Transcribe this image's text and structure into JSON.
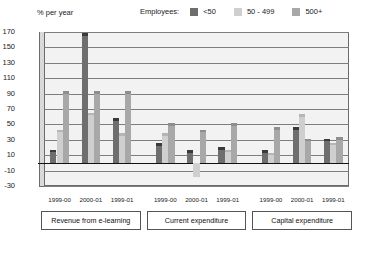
{
  "unit_label": "% per year",
  "legend": {
    "title": "Employees:",
    "items": [
      {
        "label": "<50",
        "color": "#6e6e6e"
      },
      {
        "label": "50 - 499",
        "color": "#cfcfcf"
      },
      {
        "label": "500+",
        "color": "#a8a8a8"
      }
    ]
  },
  "category_boxes": [
    {
      "label": "Revenue from e-learning"
    },
    {
      "label": "Current expenditure"
    },
    {
      "label": "Capital expenditure"
    }
  ],
  "chart_data": {
    "type": "bar",
    "title": "",
    "subtitle": "",
    "xlabel": "",
    "ylabel": "% per year",
    "ylim": [
      -30,
      170
    ],
    "yticks": [
      170,
      150,
      130,
      110,
      90,
      70,
      50,
      30,
      10,
      -10,
      -30
    ],
    "ytick_labels": [
      "170",
      "150",
      "130",
      "110",
      "90",
      "70",
      "50",
      "30",
      "10",
      "-10",
      "-30"
    ],
    "grid": true,
    "legend_position": "top-right",
    "groups": [
      "Revenue from e-learning",
      "Current expenditure",
      "Capital expenditure"
    ],
    "categories": [
      "1999-00",
      "2000-01",
      "1999-01",
      "1999-00",
      "2000-01",
      "1999-01",
      "1999-00",
      "2000-01",
      "1999-01"
    ],
    "series": [
      {
        "name": "<50",
        "color": "#6e6e6e",
        "values": [
          14,
          165,
          55,
          22,
          13,
          17,
          13,
          43,
          28
        ]
      },
      {
        "name": "50 - 499",
        "color": "#cfcfcf",
        "values": [
          40,
          62,
          35,
          35,
          -18,
          14,
          10,
          60,
          23
        ]
      },
      {
        "name": "500+",
        "color": "#a8a8a8",
        "values": [
          90,
          90,
          90,
          48,
          40,
          48,
          43,
          28,
          30
        ]
      }
    ]
  }
}
